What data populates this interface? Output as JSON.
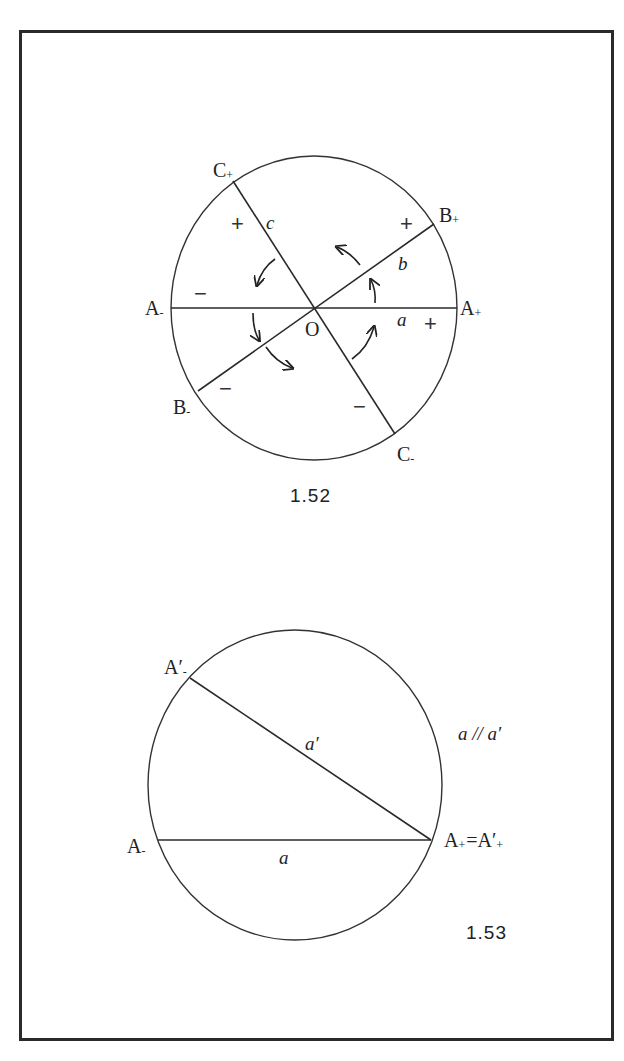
{
  "figure_1_52": {
    "caption": "1.52",
    "center_label": "O",
    "points": {
      "A_minus": {
        "base": "A",
        "sub": "-"
      },
      "A_plus": {
        "base": "A",
        "sub": "+"
      },
      "B_minus": {
        "base": "B",
        "sub": "-"
      },
      "B_plus": {
        "base": "B",
        "sub": "+"
      },
      "C_minus": {
        "base": "C",
        "sub": "-"
      },
      "C_plus": {
        "base": "C",
        "sub": "+"
      }
    },
    "lines": {
      "a": "a",
      "b": "b",
      "c": "c"
    },
    "signs": {
      "plus": "+",
      "minus": "−"
    }
  },
  "figure_1_53": {
    "caption": "1.53",
    "points": {
      "A_minus": {
        "base": "A",
        "sub": "-"
      },
      "A_prime_minus": {
        "base": "A′",
        "sub": "-"
      },
      "A_plus_eq": {
        "base": "A",
        "sub": "+",
        "eq": "=",
        "base2": "A′",
        "sub2": "+"
      }
    },
    "lines": {
      "a": "a",
      "a_prime": "a′"
    },
    "relation": "a // a′"
  },
  "colors": {
    "ink": "#222222",
    "paper": "#ffffff",
    "frame": "#2a2a2a"
  }
}
